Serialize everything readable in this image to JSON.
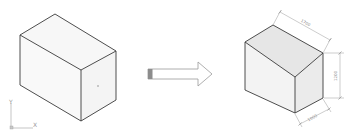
{
  "diagram": {
    "left_figure": {
      "name": "undimensioned-box",
      "face_colors": {
        "top": "#f7f7f7",
        "left": "#f9f9f9",
        "right": "#f4f4f4"
      },
      "edge_color": "#3a3a3a"
    },
    "arrow": {
      "name": "transform-arrow",
      "tail_fill": "#8c8c8c",
      "outline": "#9a9a9a"
    },
    "right_figure": {
      "name": "dimensioned-box",
      "face_colors": {
        "top": "#e6e6e6",
        "left": "#f3f3f3",
        "right": "#ebebeb"
      },
      "edge_color": "#3a3a3a",
      "dimensions": {
        "length": "1700",
        "height": "1200",
        "width": "1000"
      },
      "dimension_color": "#8a8a8a"
    },
    "ucs_icon": {
      "x_label": "X",
      "y_label": "Y"
    }
  }
}
